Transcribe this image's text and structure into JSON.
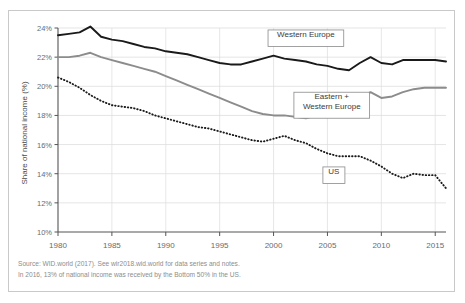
{
  "chart_data": {
    "type": "line",
    "title": "",
    "xlabel": "",
    "ylabel": "Share of national income (%)",
    "xlim": [
      1980,
      2016
    ],
    "ylim": [
      10,
      24
    ],
    "grid": true,
    "legend_position": "inline-annotations",
    "xticks": [
      "1980",
      "1985",
      "1990",
      "1995",
      "2000",
      "2005",
      "2010",
      "2015"
    ],
    "xtick_values": [
      1980,
      1985,
      1990,
      1995,
      2000,
      2005,
      2010,
      2015
    ],
    "yticks": [
      "10%",
      "12%",
      "14%",
      "16%",
      "18%",
      "20%",
      "22%",
      "24%"
    ],
    "ytick_values": [
      10,
      12,
      14,
      16,
      18,
      20,
      22,
      24
    ],
    "x": [
      1980,
      1981,
      1982,
      1983,
      1984,
      1985,
      1986,
      1987,
      1988,
      1989,
      1990,
      1991,
      1992,
      1993,
      1994,
      1995,
      1996,
      1997,
      1998,
      1999,
      2000,
      2001,
      2002,
      2003,
      2004,
      2005,
      2006,
      2007,
      2008,
      2009,
      2010,
      2011,
      2012,
      2013,
      2014,
      2015,
      2016
    ],
    "series": [
      {
        "name": "Western Europe",
        "color": "#1a1a1a",
        "style": "solid",
        "values": [
          23.5,
          23.6,
          23.7,
          24.1,
          23.4,
          23.2,
          23.1,
          22.9,
          22.7,
          22.6,
          22.4,
          22.3,
          22.2,
          22.0,
          21.8,
          21.6,
          21.5,
          21.5,
          21.7,
          21.9,
          22.1,
          21.9,
          21.8,
          21.7,
          21.5,
          21.4,
          21.2,
          21.1,
          21.6,
          22.0,
          21.6,
          21.5,
          21.8,
          21.8,
          21.8,
          21.8,
          21.7
        ]
      },
      {
        "name": "Eastern + Western Europe",
        "color": "#8c8c8c",
        "style": "solid",
        "values": [
          22.0,
          22.0,
          22.1,
          22.3,
          22.0,
          21.8,
          21.6,
          21.4,
          21.2,
          21.0,
          20.7,
          20.4,
          20.1,
          19.8,
          19.5,
          19.2,
          18.9,
          18.6,
          18.3,
          18.1,
          18.0,
          18.0,
          17.9,
          17.8,
          18.0,
          18.1,
          18.1,
          18.6,
          19.1,
          19.6,
          19.2,
          19.3,
          19.6,
          19.8,
          19.9,
          19.9,
          19.9
        ]
      },
      {
        "name": "US",
        "color": "#1a1a1a",
        "style": "dotted",
        "values": [
          20.6,
          20.3,
          19.9,
          19.4,
          19.0,
          18.7,
          18.6,
          18.5,
          18.3,
          18.0,
          17.8,
          17.6,
          17.4,
          17.2,
          17.1,
          16.9,
          16.7,
          16.5,
          16.3,
          16.2,
          16.4,
          16.6,
          16.3,
          16.1,
          15.7,
          15.4,
          15.2,
          15.2,
          15.2,
          14.9,
          14.5,
          14.0,
          13.7,
          14.0,
          13.9,
          13.9,
          13.0
        ]
      }
    ],
    "annotations": [
      {
        "id": "western-europe",
        "label": "Western Europe",
        "lines": [
          "Western Europe"
        ],
        "x": 2003,
        "y": 23.3
      },
      {
        "id": "eastern-western-europe",
        "label": "Eastern + Western Europe",
        "lines": [
          "Eastern +",
          "Western Europe"
        ],
        "x": 2005.4,
        "y": 18.7
      },
      {
        "id": "us",
        "label": "US",
        "lines": [
          "US"
        ],
        "x": 2005.6,
        "y": 13.9
      }
    ]
  },
  "footer": {
    "line1": "Source:  WID.world (2017). See wir2018.wid.world for data series and notes.",
    "line2": "In 2016, 13% of national income was received by the Bottom 50% in the US."
  },
  "colors": {
    "series_black": "#1a1a1a",
    "series_gray": "#8c8c8c",
    "grid": "#d8d8d8",
    "axis": "#555555",
    "tick_text": "#6b6b6b",
    "footer_text": "#8d8d8d",
    "frame": "#c9c9c9",
    "background": "#ffffff"
  }
}
